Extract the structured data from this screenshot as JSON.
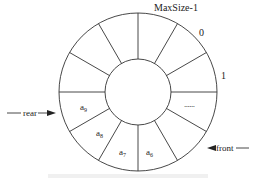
{
  "diagram": {
    "type": "circular-queue",
    "segments": 12,
    "center": [
      138,
      92
    ],
    "outer_radius": 79,
    "inner_radius": 33,
    "stroke_color": "#333333",
    "slot_labels": {
      "maxsize_minus_1": "MaxSize-1",
      "zero": "0",
      "one": "1",
      "ellipsis": "......"
    },
    "elements": {
      "a9": {
        "base": "a",
        "sub": "9"
      },
      "a8": {
        "base": "a",
        "sub": "8"
      },
      "a7": {
        "base": "a",
        "sub": "7"
      },
      "a6": {
        "base": "a",
        "sub": "6"
      }
    },
    "pointers": {
      "rear": "rear",
      "front": "front"
    }
  }
}
